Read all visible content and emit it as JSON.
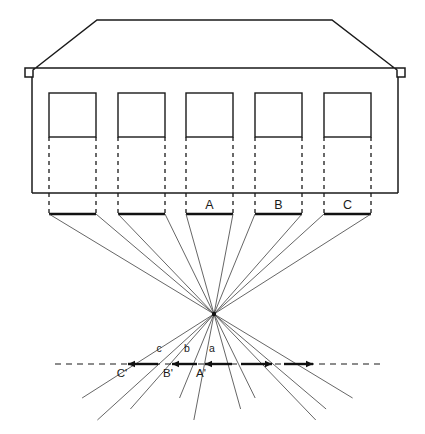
{
  "figure": {
    "domain_note": "line-drawing diagram",
    "ink_color": "#1a1a1a",
    "paper_color": "#ffffff",
    "ray_color": "#4a4a4a",
    "width": 425,
    "height": 434
  },
  "building": {
    "name": "house-elevation",
    "roof": {
      "ridge_left_x": 97,
      "ridge_right_x": 332,
      "ridge_y": 20,
      "eave_left_x": 25,
      "eave_right_x": 405,
      "eave_y": 77,
      "notch_depth": 9
    },
    "walls": {
      "left_x": 32,
      "right_x": 398,
      "top_y": 77,
      "base_y": 193
    },
    "windows": {
      "count": 5,
      "width": 47,
      "top_y": 93,
      "sill_y": 137,
      "left_edges": [
        49,
        118,
        186,
        255,
        324
      ]
    }
  },
  "ground_segments": {
    "name": "object-segments",
    "y": 214,
    "items": [
      {
        "id": "seg-1",
        "x1": 49,
        "x2": 96,
        "label": ""
      },
      {
        "id": "seg-2",
        "x1": 118,
        "x2": 165,
        "label": ""
      },
      {
        "id": "seg-3",
        "x1": 186,
        "x2": 233,
        "label": "A"
      },
      {
        "id": "seg-4",
        "x1": 255,
        "x2": 302,
        "label": "B"
      },
      {
        "id": "seg-5",
        "x1": 324,
        "x2": 371,
        "label": "C"
      }
    ],
    "label_y": 209,
    "labels": [
      "A",
      "B",
      "C"
    ]
  },
  "dashed_drops": {
    "name": "projection-drop-lines",
    "from_y": 137,
    "to_y": 214,
    "x_positions": [
      49,
      96,
      118,
      165,
      186,
      233,
      255,
      302,
      324,
      371
    ]
  },
  "station_point": {
    "name": "vanishing-point",
    "x": 214,
    "y": 314,
    "marker_radius": 2.2
  },
  "picture_plane": {
    "name": "picture-plane-line",
    "y": 364,
    "x_start": 55,
    "x_end": 382,
    "dash": "6 5"
  },
  "image_segments": {
    "name": "image-segments",
    "y": 364,
    "items": [
      {
        "id": "img-C",
        "x1": 128,
        "x2": 158,
        "arrow": "left"
      },
      {
        "id": "img-B",
        "x1": 172,
        "x2": 197,
        "arrow": "left"
      },
      {
        "id": "img-A",
        "x1": 205,
        "x2": 232,
        "arrow": "left"
      },
      {
        "id": "img-a2",
        "x1": 241,
        "x2": 272,
        "arrow": "right"
      },
      {
        "id": "img-b2",
        "x1": 284,
        "x2": 313,
        "arrow": "right"
      }
    ]
  },
  "labels_lower": {
    "name": "interval-labels",
    "y": 352,
    "items": [
      {
        "text": "c",
        "x": 159
      },
      {
        "text": "b",
        "x": 187
      },
      {
        "text": "a",
        "x": 212
      }
    ]
  },
  "labels_primed": {
    "name": "image-point-labels",
    "y": 377,
    "items": [
      {
        "text": "C'",
        "x": 122
      },
      {
        "text": "B'",
        "x": 168
      },
      {
        "text": "A'",
        "x": 201
      }
    ]
  },
  "rays": {
    "name": "projection-rays",
    "upper_from_y": 214,
    "upper_x_positions": [
      49,
      96,
      118,
      165,
      186,
      233,
      255,
      302,
      324,
      371
    ],
    "lower_end_y_min": 398,
    "lower_end_y_max": 420,
    "lower_x_positions": [
      49,
      96,
      118,
      165,
      186,
      233,
      255,
      302,
      324,
      371
    ]
  }
}
